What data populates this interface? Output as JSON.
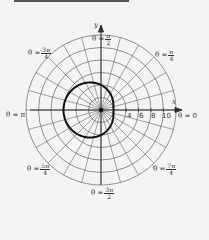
{
  "chart_data": {
    "type": "polar",
    "title": "",
    "equation_estimate": "r = 4 - 2cos(theta)",
    "axes": {
      "x_label": "x",
      "y_label": "y"
    },
    "radial_ticks": [
      "4",
      "6",
      "8",
      "10"
    ],
    "radial_grid": [
      2,
      4,
      6,
      8,
      10,
      12
    ],
    "angular_grid_step_deg": 15,
    "angle_labels": [
      {
        "id": "t0",
        "text": "θ = 0",
        "num": "",
        "den": ""
      },
      {
        "id": "t1",
        "text": "θ =",
        "num": "π",
        "den": "4"
      },
      {
        "id": "t2",
        "text": "θ =",
        "num": "π",
        "den": "2"
      },
      {
        "id": "t3",
        "text": "θ =",
        "num": "3π",
        "den": "4"
      },
      {
        "id": "t4",
        "text": "θ = π",
        "num": "",
        "den": ""
      },
      {
        "id": "t5",
        "text": "θ =",
        "num": "5π",
        "den": "4"
      },
      {
        "id": "t6",
        "text": "θ =",
        "num": "3π",
        "den": "2"
      },
      {
        "id": "t7",
        "text": "θ =",
        "num": "7π",
        "den": "4"
      }
    ],
    "curve_samples": [
      {
        "theta": "0",
        "r": 2
      },
      {
        "theta": "π/2",
        "r": 4
      },
      {
        "theta": "π",
        "r": 6
      },
      {
        "theta": "3π/2",
        "r": 4
      }
    ],
    "rlim": [
      0,
      12
    ],
    "grid": true,
    "legend": "none"
  },
  "labels": {
    "x_axis": "x",
    "y_axis": "y",
    "tick_4": "4",
    "tick_6": "6",
    "tick_8": "8",
    "tick_10": "10",
    "theta_0": "θ = 0",
    "theta_pi": "θ = π",
    "theta_eq": "θ =",
    "pi_over_4_num": "π",
    "pi_over_4_den": "4",
    "pi_over_2_num": "π",
    "pi_over_2_den": "2",
    "3pi_over_4_num": "3π",
    "3pi_over_4_den": "4",
    "5pi_over_4_num": "5π",
    "5pi_over_4_den": "4",
    "3pi_over_2_num": "3π",
    "3pi_over_2_den": "2",
    "7pi_over_4_num": "7π",
    "7pi_over_4_den": "4"
  },
  "colors": {
    "grid": "#555555",
    "curve": "#111111",
    "axis": "#333333",
    "background": "#f4f4f3"
  }
}
